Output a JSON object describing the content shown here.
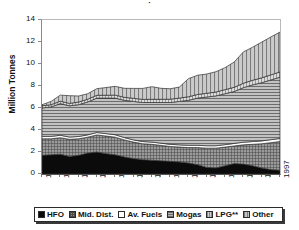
{
  "title_stub": "·",
  "legend": {
    "items": [
      {
        "label": "HFO",
        "swatch": "sw-hfo",
        "name": "legend-item-hfo"
      },
      {
        "label": "Mid. Dist.",
        "swatch": "sw-mid",
        "name": "legend-item-mid-dist"
      },
      {
        "label": "Av. Fuels",
        "swatch": "sw-av",
        "name": "legend-item-av-fuels"
      },
      {
        "label": "Mogas",
        "swatch": "sw-mogas",
        "name": "legend-item-mogas"
      },
      {
        "label": "LPG**",
        "swatch": "sw-lpg",
        "name": "legend-item-lpg"
      },
      {
        "label": "Other",
        "swatch": "sw-other",
        "name": "legend-item-other"
      }
    ]
  },
  "chart_data": {
    "type": "area",
    "stacked": true,
    "title": "",
    "xlabel": "",
    "ylabel": "Million Tonnes",
    "ylim": [
      0,
      14
    ],
    "yticks": [
      0,
      2,
      4,
      6,
      8,
      10,
      12,
      14
    ],
    "grid": false,
    "legend_position": "bottom",
    "xtick_labels": [
      "1971",
      "1973",
      "1975",
      "1977",
      "1979",
      "1981",
      "1983",
      "1985",
      "1987",
      "1989",
      "1991",
      "1993",
      "1995",
      "1997"
    ],
    "xtick_rotation": -90,
    "x": [
      1971,
      1972,
      1973,
      1974,
      1975,
      1976,
      1977,
      1978,
      1979,
      1980,
      1981,
      1982,
      1983,
      1984,
      1985,
      1986,
      1987,
      1988,
      1989,
      1990,
      1991,
      1992,
      1993,
      1994,
      1995,
      1996,
      1997
    ],
    "series": [
      {
        "name": "HFO",
        "color": "#0b0b0b",
        "pattern": "solid",
        "values": [
          1.7,
          1.75,
          1.8,
          1.6,
          1.7,
          1.9,
          2.0,
          1.85,
          1.75,
          1.55,
          1.4,
          1.3,
          1.25,
          1.2,
          1.15,
          1.1,
          1.0,
          0.85,
          0.6,
          0.55,
          0.75,
          0.95,
          0.9,
          0.75,
          0.55,
          0.4,
          0.35
        ]
      },
      {
        "name": "Mid. Dist.",
        "color": "#8d8d8d",
        "pattern": "crosshatch",
        "values": [
          1.5,
          1.45,
          1.5,
          1.55,
          1.5,
          1.45,
          1.55,
          1.6,
          1.6,
          1.55,
          1.5,
          1.45,
          1.45,
          1.4,
          1.35,
          1.35,
          1.4,
          1.55,
          1.75,
          1.8,
          1.7,
          1.6,
          1.75,
          1.95,
          2.2,
          2.45,
          2.6
        ]
      },
      {
        "name": "Av. Fuels",
        "color": "#ffffff",
        "pattern": "none",
        "values": [
          0.22,
          0.22,
          0.22,
          0.21,
          0.21,
          0.21,
          0.22,
          0.22,
          0.22,
          0.21,
          0.2,
          0.2,
          0.2,
          0.2,
          0.2,
          0.2,
          0.21,
          0.21,
          0.22,
          0.22,
          0.22,
          0.23,
          0.24,
          0.25,
          0.26,
          0.27,
          0.28
        ]
      },
      {
        "name": "Mogas",
        "color": "#b4b4b4",
        "pattern": "horizontal-lines",
        "values": [
          2.58,
          2.68,
          2.88,
          2.84,
          2.89,
          2.99,
          3.13,
          3.23,
          3.33,
          3.39,
          3.5,
          3.55,
          3.6,
          3.7,
          3.8,
          3.95,
          4.09,
          4.29,
          4.43,
          4.53,
          4.63,
          4.72,
          4.96,
          5.15,
          5.29,
          5.43,
          5.57
        ]
      },
      {
        "name": "LPG**",
        "color": "#cfcfcf",
        "pattern": "vertical-lines",
        "values": [
          0.2,
          0.2,
          0.22,
          0.22,
          0.24,
          0.25,
          0.26,
          0.26,
          0.27,
          0.27,
          0.28,
          0.28,
          0.29,
          0.29,
          0.3,
          0.3,
          0.32,
          0.33,
          0.34,
          0.35,
          0.37,
          0.38,
          0.4,
          0.42,
          0.44,
          0.46,
          0.48
        ]
      },
      {
        "name": "Other",
        "color": "#c2c2c2",
        "pattern": "vertical-bars",
        "values": [
          0.1,
          0.3,
          0.55,
          0.7,
          0.55,
          0.5,
          0.6,
          0.7,
          0.8,
          0.82,
          0.9,
          1.0,
          1.15,
          1.0,
          0.95,
          1.0,
          1.65,
          1.75,
          1.75,
          1.85,
          2.0,
          2.3,
          2.85,
          3.0,
          3.25,
          3.45,
          3.62
        ]
      }
    ],
    "totals": [
      6.3,
      6.6,
      7.17,
      7.12,
      7.09,
      7.3,
      7.76,
      7.86,
      7.97,
      7.79,
      7.78,
      7.78,
      7.94,
      7.74,
      7.75,
      7.9,
      8.67,
      8.98,
      9.09,
      9.3,
      9.67,
      10.18,
      11.1,
      11.52,
      11.99,
      12.46,
      12.9
    ]
  }
}
